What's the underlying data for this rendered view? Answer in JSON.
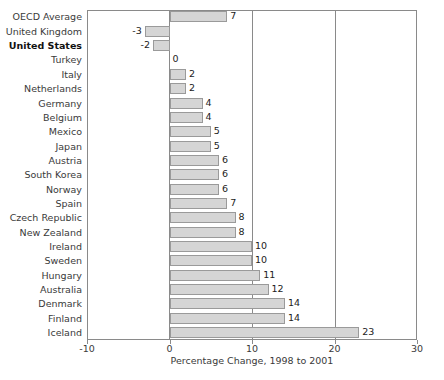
{
  "chart_data": {
    "type": "bar",
    "orientation": "horizontal",
    "title": "",
    "xlabel": "Percentage Change, 1998 to 2001",
    "ylabel": "",
    "xlim": [
      -10,
      30
    ],
    "xticks": [
      -10,
      0,
      10,
      20,
      30
    ],
    "xtick_labels": [
      "-10",
      "0",
      "10",
      "20",
      "30"
    ],
    "grid": true,
    "grid_axis": "x",
    "legend": null,
    "bar_fill_color": "#d5d5d5",
    "bar_edge_color": "#9a9a9a",
    "highlight_category": "United States",
    "categories": [
      "OECD Average",
      "United Kingdom",
      "United States",
      "Turkey",
      "Italy",
      "Netherlands",
      "Germany",
      "Belgium",
      "Mexico",
      "Japan",
      "Austria",
      "South Korea",
      "Norway",
      "Spain",
      "Czech Republic",
      "New Zealand",
      "Ireland",
      "Sweden",
      "Hungary",
      "Australia",
      "Denmark",
      "Finland",
      "Iceland"
    ],
    "values": [
      7,
      -3,
      -2,
      0,
      2,
      2,
      4,
      4,
      5,
      5,
      6,
      6,
      6,
      7,
      8,
      8,
      10,
      10,
      11,
      12,
      14,
      14,
      23
    ],
    "value_labels": [
      "7",
      "-3",
      "-2",
      "0",
      "2",
      "2",
      "4",
      "4",
      "5",
      "5",
      "6",
      "6",
      "6",
      "7",
      "8",
      "8",
      "10",
      "10",
      "11",
      "12",
      "14",
      "14",
      "23"
    ],
    "bold_categories": [
      "United States"
    ]
  }
}
